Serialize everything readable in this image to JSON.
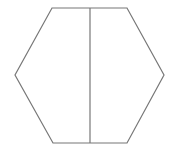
{
  "diagram": {
    "shape": "hexagon",
    "stroke_color": "#777777",
    "fill_color": "#ffffff",
    "background": "#ffffff",
    "stroke_width": 1.2,
    "vertices": [
      [
        52,
        8
      ],
      [
        127,
        8
      ],
      [
        164,
        75
      ],
      [
        127,
        143
      ],
      [
        53,
        143
      ],
      [
        15,
        75
      ]
    ],
    "divider": {
      "x1": 90,
      "y1": 8,
      "x2": 90,
      "y2": 143
    }
  }
}
